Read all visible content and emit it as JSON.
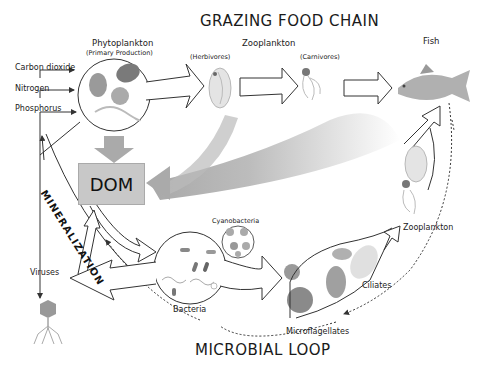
{
  "titles": {
    "top": "GRAZING FOOD CHAIN",
    "bottom": "MICROBIAL LOOP"
  },
  "grazing_chain": {
    "phytoplankton": {
      "label": "Phytoplankton",
      "sublabel": "(Primary Production)"
    },
    "zooplankton": {
      "label": "Zooplankton"
    },
    "herbivores": {
      "label": "(Herbivores)"
    },
    "carnivores": {
      "label": "(Carnivores)"
    },
    "fish": {
      "label": "Fish"
    }
  },
  "nutrients": [
    {
      "label": "Carbon dioxide"
    },
    {
      "label": "Nitrogen"
    },
    {
      "label": "Phosphorus"
    }
  ],
  "dom": {
    "label": "DOM"
  },
  "mineralization": {
    "label": "MINERALIZATION"
  },
  "microbial_loop": {
    "viruses": {
      "label": "Viruses"
    },
    "bacteria": {
      "label": "Bacteria"
    },
    "cyanobacteria": {
      "label": "Cyanobacteria"
    },
    "microflagellates": {
      "label": "Microflagellates"
    },
    "ciliates": {
      "label": "Ciliates"
    },
    "zooplankton": {
      "label": "Zooplankton"
    }
  },
  "colors": {
    "organism_gray": "#9a9a9a",
    "dom_fill": "#c8c8c8",
    "flow_gray": "#b5b5b5",
    "outline": "#333333"
  }
}
